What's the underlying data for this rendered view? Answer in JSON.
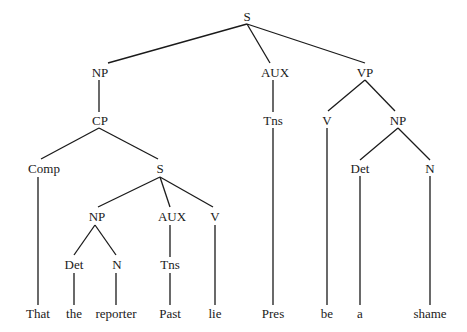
{
  "diagram": {
    "type": "syntax-tree",
    "sentence": "That the reporter Past lie Pres be a shame",
    "line_color": "#1a1a1a",
    "nodes": [
      {
        "id": "s_root",
        "label": "S",
        "x": 247,
        "y": 16
      },
      {
        "id": "np_subj",
        "label": "NP",
        "x": 100,
        "y": 72
      },
      {
        "id": "aux_main",
        "label": "AUX",
        "x": 275,
        "y": 72
      },
      {
        "id": "vp_main",
        "label": "VP",
        "x": 365,
        "y": 72
      },
      {
        "id": "cp",
        "label": "CP",
        "x": 100,
        "y": 120
      },
      {
        "id": "tns_main",
        "label": "Tns",
        "x": 273,
        "y": 120
      },
      {
        "id": "v_main",
        "label": "V",
        "x": 327,
        "y": 120
      },
      {
        "id": "np_obj",
        "label": "NP",
        "x": 398,
        "y": 120
      },
      {
        "id": "comp",
        "label": "Comp",
        "x": 44,
        "y": 168
      },
      {
        "id": "s_emb",
        "label": "S",
        "x": 160,
        "y": 168
      },
      {
        "id": "det_obj",
        "label": "Det",
        "x": 360,
        "y": 168
      },
      {
        "id": "n_obj",
        "label": "N",
        "x": 430,
        "y": 168
      },
      {
        "id": "np_emb",
        "label": "NP",
        "x": 97,
        "y": 216
      },
      {
        "id": "aux_emb",
        "label": "AUX",
        "x": 172,
        "y": 216
      },
      {
        "id": "v_emb",
        "label": "V",
        "x": 215,
        "y": 216
      },
      {
        "id": "det_emb",
        "label": "Det",
        "x": 74,
        "y": 264
      },
      {
        "id": "n_emb",
        "label": "N",
        "x": 117,
        "y": 264
      },
      {
        "id": "tns_emb",
        "label": "Tns",
        "x": 170,
        "y": 264
      },
      {
        "id": "w_that",
        "label": "That",
        "x": 38,
        "y": 313
      },
      {
        "id": "w_the",
        "label": "the",
        "x": 74,
        "y": 313
      },
      {
        "id": "w_reporter",
        "label": "reporter",
        "x": 116,
        "y": 313
      },
      {
        "id": "w_past",
        "label": "Past",
        "x": 170,
        "y": 313
      },
      {
        "id": "w_lie",
        "label": "lie",
        "x": 215,
        "y": 313
      },
      {
        "id": "w_pres",
        "label": "Pres",
        "x": 273,
        "y": 313
      },
      {
        "id": "w_be",
        "label": "be",
        "x": 327,
        "y": 313
      },
      {
        "id": "w_a",
        "label": "a",
        "x": 360,
        "y": 313
      },
      {
        "id": "w_shame",
        "label": "shame",
        "x": 430,
        "y": 313
      }
    ],
    "edges": [
      {
        "x1": 247,
        "y1": 24,
        "x2": 108,
        "y2": 63
      },
      {
        "x1": 247,
        "y1": 24,
        "x2": 270,
        "y2": 63
      },
      {
        "x1": 247,
        "y1": 24,
        "x2": 365,
        "y2": 63
      },
      {
        "x1": 99,
        "y1": 80,
        "x2": 99,
        "y2": 112
      },
      {
        "x1": 273,
        "y1": 80,
        "x2": 273,
        "y2": 112
      },
      {
        "x1": 365,
        "y1": 80,
        "x2": 328,
        "y2": 111
      },
      {
        "x1": 365,
        "y1": 80,
        "x2": 395,
        "y2": 111
      },
      {
        "x1": 99,
        "y1": 128,
        "x2": 41,
        "y2": 159
      },
      {
        "x1": 99,
        "y1": 128,
        "x2": 158,
        "y2": 159
      },
      {
        "x1": 273,
        "y1": 128,
        "x2": 273,
        "y2": 305
      },
      {
        "x1": 327,
        "y1": 128,
        "x2": 327,
        "y2": 305
      },
      {
        "x1": 398,
        "y1": 128,
        "x2": 360,
        "y2": 160
      },
      {
        "x1": 398,
        "y1": 128,
        "x2": 430,
        "y2": 160
      },
      {
        "x1": 38,
        "y1": 177,
        "x2": 38,
        "y2": 305
      },
      {
        "x1": 160,
        "y1": 177,
        "x2": 98,
        "y2": 207
      },
      {
        "x1": 160,
        "y1": 177,
        "x2": 170,
        "y2": 207
      },
      {
        "x1": 160,
        "y1": 177,
        "x2": 213,
        "y2": 207
      },
      {
        "x1": 360,
        "y1": 176,
        "x2": 360,
        "y2": 305
      },
      {
        "x1": 430,
        "y1": 176,
        "x2": 430,
        "y2": 305
      },
      {
        "x1": 95,
        "y1": 225,
        "x2": 74,
        "y2": 255
      },
      {
        "x1": 95,
        "y1": 225,
        "x2": 116,
        "y2": 255
      },
      {
        "x1": 170,
        "y1": 225,
        "x2": 170,
        "y2": 257
      },
      {
        "x1": 215,
        "y1": 225,
        "x2": 215,
        "y2": 305
      },
      {
        "x1": 74,
        "y1": 273,
        "x2": 74,
        "y2": 305
      },
      {
        "x1": 116,
        "y1": 273,
        "x2": 116,
        "y2": 305
      },
      {
        "x1": 170,
        "y1": 273,
        "x2": 170,
        "y2": 305
      }
    ]
  }
}
